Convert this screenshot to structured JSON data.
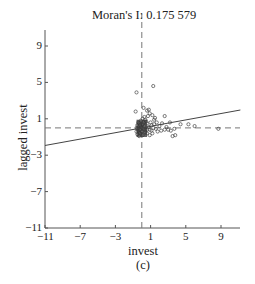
{
  "chart_data": {
    "type": "scatter",
    "title": "Moran's I: 0.175 579",
    "xlabel": "invest",
    "ylabel": "lagged invest",
    "caption": "(c)",
    "xlim": [
      -11,
      11
    ],
    "ylim": [
      -11,
      11
    ],
    "xticks": [
      -11,
      -7,
      -3,
      1,
      5,
      9
    ],
    "yticks": [
      -11,
      -7,
      -3,
      1,
      5,
      9
    ],
    "grid": false,
    "reference_lines": {
      "x": 0,
      "y": 0,
      "style": "dashed"
    },
    "regression_line": {
      "slope": 0.175579,
      "intercept": 0
    },
    "series": [
      {
        "name": "observations",
        "marker": "open-circle",
        "points": [
          [
            -0.6,
            3.9
          ],
          [
            1.3,
            4.6
          ],
          [
            -0.7,
            1.8
          ],
          [
            0.2,
            2.2
          ],
          [
            0.6,
            1.9
          ],
          [
            0.8,
            2.0
          ],
          [
            0.9,
            1.6
          ],
          [
            1.2,
            1.4
          ],
          [
            1.5,
            1.1
          ],
          [
            2.6,
            1.3
          ],
          [
            3.2,
            0.6
          ],
          [
            4.4,
            0.4
          ],
          [
            5.3,
            0.4
          ],
          [
            6.0,
            0.2
          ],
          [
            8.7,
            -0.1
          ],
          [
            3.7,
            -0.1
          ],
          [
            3.3,
            -0.3
          ],
          [
            3.8,
            -0.8
          ],
          [
            3.5,
            -0.9
          ],
          [
            2.2,
            -0.3
          ],
          [
            2.6,
            -0.2
          ],
          [
            3.0,
            -0.2
          ],
          [
            2.0,
            0.2
          ],
          [
            1.7,
            0.6
          ],
          [
            1.4,
            0.9
          ],
          [
            1.1,
            0.3
          ],
          [
            1.8,
            -0.4
          ],
          [
            1.2,
            -0.6
          ],
          [
            0.9,
            -0.2
          ],
          [
            0.6,
            0.5
          ],
          [
            0.4,
            0.9
          ],
          [
            0.3,
            1.2
          ],
          [
            0.1,
            1.0
          ],
          [
            -0.1,
            0.8
          ],
          [
            -0.3,
            0.5
          ],
          [
            -0.5,
            0.3
          ],
          [
            -0.6,
            0.0
          ],
          [
            -0.4,
            -0.3
          ],
          [
            -0.2,
            -0.6
          ],
          [
            0.0,
            -0.4
          ],
          [
            0.2,
            -0.1
          ],
          [
            0.4,
            -0.5
          ],
          [
            0.6,
            -0.2
          ],
          [
            0.8,
            0.1
          ],
          [
            -0.3,
            -0.9
          ],
          [
            -0.5,
            -0.7
          ],
          [
            0.1,
            0.4
          ],
          [
            0.3,
            0.2
          ],
          [
            -0.1,
            0.1
          ],
          [
            -0.2,
            -0.2
          ],
          [
            0.5,
            0.7
          ],
          [
            0.7,
            1.3
          ],
          [
            1.0,
            0.6
          ],
          [
            1.3,
            0.0
          ],
          [
            1.6,
            -0.1
          ],
          [
            2.3,
            0.5
          ],
          [
            2.8,
            0.1
          ],
          [
            0.9,
            -0.8
          ],
          [
            -0.6,
            -0.4
          ],
          [
            -0.4,
            0.6
          ],
          [
            -0.2,
            0.3
          ],
          [
            0.0,
            0.0
          ],
          [
            0.2,
            0.6
          ],
          [
            0.4,
            -0.2
          ],
          [
            -0.5,
            -0.1
          ],
          [
            -0.3,
            -0.5
          ],
          [
            0.1,
            -0.8
          ],
          [
            0.6,
            -0.6
          ],
          [
            1.1,
            -0.3
          ],
          [
            1.4,
            0.4
          ]
        ]
      }
    ]
  }
}
